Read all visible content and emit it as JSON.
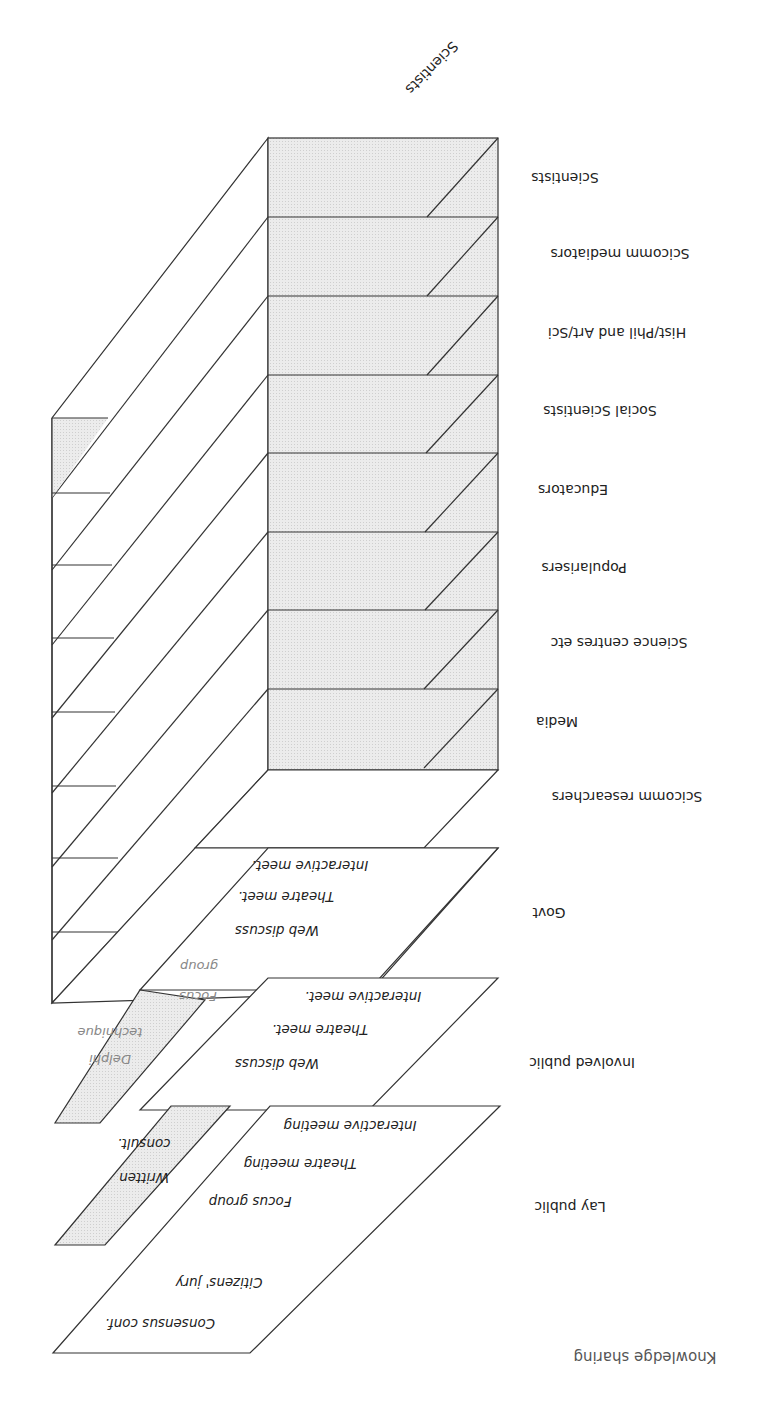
{
  "diagram": {
    "title": "Knowledge sharing",
    "orientation": "rotated 180 degrees",
    "column_header": "Scientists",
    "rows": [
      {
        "label": "Scientists"
      },
      {
        "label": "Scicomm mediators"
      },
      {
        "label": "Hist/Phil and Art/Sci"
      },
      {
        "label": "Social Scientists"
      },
      {
        "label": "Educators"
      },
      {
        "label": "Popularisers"
      },
      {
        "label": "Science centres etc"
      },
      {
        "label": "Media"
      },
      {
        "label": "Scicomm researchers"
      },
      {
        "label": "Govt"
      },
      {
        "label": "Involved public"
      },
      {
        "label": "Lay public"
      }
    ],
    "layers": {
      "govt": {
        "methods": [
          "Web discuss",
          "Theatre meet.",
          "Interactive meet."
        ],
        "side_methods": [
          "Focus",
          "group"
        ]
      },
      "involved_public": {
        "methods": [
          "Web discuss",
          "Theatre meet.",
          "Interactive meet."
        ],
        "side_methods": [
          "Delphi",
          "technique"
        ]
      },
      "lay_public": {
        "methods": [
          "Consensus conf.",
          "Citizens' jury",
          "Focus group",
          "Theatre meeting",
          "Interactive meeting"
        ],
        "side_methods": [
          "Written",
          "consult."
        ]
      }
    },
    "colors": {
      "line": "#333333",
      "fill_gray": "#e6e6e6",
      "fill_white": "#ffffff",
      "faint_text": "#888888"
    }
  }
}
